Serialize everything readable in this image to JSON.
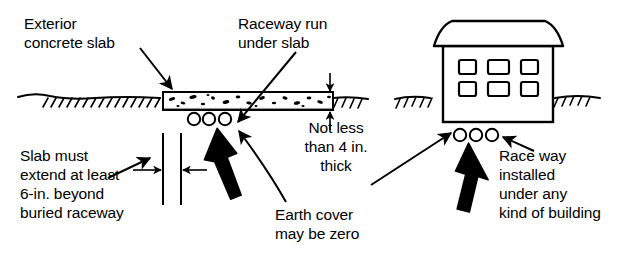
{
  "figure": {
    "line_color": "#000000",
    "fill_color": "#ffffff",
    "background": "#ffffff"
  },
  "labels": {
    "exterior_slab": "Exterior\nconcrete slab",
    "raceway_run": "Raceway run\nunder slab",
    "not_less_than": "Not less\nthan 4 in.\nthick",
    "slab_extend": "Slab must\nextend at least\n6-in. beyond\nburied raceway",
    "earth_cover": "Earth cover\nmay be zero",
    "raceway_building": "Race way\ninstalled\nunder any\nkind of building"
  },
  "left_diagram": {
    "name": "exterior-concrete-slab-section",
    "ground_line": "grade-hatching",
    "slab": {
      "name": "concrete-slab",
      "thickness_note": "Not less than 4 in. thick",
      "aggregate": "speckled-concrete-fill"
    },
    "raceways": {
      "name": "buried-raceway-conduits",
      "count": 3
    },
    "dimension": {
      "name": "six-inch-extension-dimension",
      "value": "6-in."
    }
  },
  "right_diagram": {
    "name": "building-section",
    "building": {
      "name": "building-outline",
      "roof": "gable-roof",
      "window_rows": 2,
      "window_cols": 3,
      "windows": 6
    },
    "ground_line": "grade-hatching",
    "raceways": {
      "name": "raceway-conduits-under-building",
      "count": 3
    }
  }
}
